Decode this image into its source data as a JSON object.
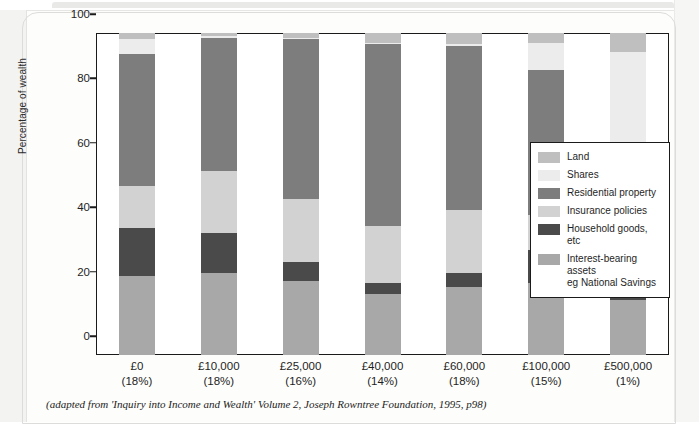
{
  "chart_data": {
    "type": "bar",
    "subtype": "stacked-percentage",
    "title": "",
    "xlabel": "",
    "ylabel": "Percentage of wealth",
    "ylim": [
      0,
      100
    ],
    "yticks": [
      0,
      20,
      40,
      60,
      80,
      100
    ],
    "grid": false,
    "legend_position": "right-inside",
    "categories": [
      "£0",
      "£10,000",
      "£25,000",
      "£40,000",
      "£60,000",
      "£100,000",
      "£500,000"
    ],
    "category_sublabels": [
      "(18%)",
      "(18%)",
      "(16%)",
      "(14%)",
      "(18%)",
      "(15%)",
      "(1%)"
    ],
    "series": [
      {
        "name": "Interest-bearing assets eg National Savings",
        "color": "#a8a8a8",
        "values": [
          24.5,
          25.5,
          23.0,
          19.0,
          21.0,
          22.5,
          17.0
        ]
      },
      {
        "name": "Household goods, etc",
        "color": "#4a4a4a",
        "values": [
          15.0,
          12.5,
          6.0,
          3.5,
          4.5,
          10.0,
          13.0
        ]
      },
      {
        "name": "Insurance policies",
        "color": "#d2d2d2",
        "values": [
          13.0,
          19.0,
          19.5,
          17.5,
          19.5,
          11.0,
          10.0
        ]
      },
      {
        "name": "Residential property",
        "color": "#7d7d7d",
        "values": [
          41.0,
          41.5,
          49.5,
          56.5,
          51.0,
          45.0,
          17.0
        ]
      },
      {
        "name": "Shares",
        "color": "#ececec",
        "values": [
          4.5,
          0.5,
          0.5,
          0.5,
          0.5,
          8.5,
          37.0
        ]
      },
      {
        "name": "Land",
        "color": "#bfbfbf",
        "values": [
          2.0,
          1.0,
          1.5,
          3.0,
          3.5,
          3.0,
          6.0
        ]
      }
    ]
  },
  "figure": {
    "y_axis_label": "Percentage of wealth",
    "y_ticks": [
      "0",
      "20",
      "40",
      "60",
      "80",
      "100"
    ],
    "x_ticks": [
      {
        "value": "£0",
        "share": "(18%)"
      },
      {
        "value": "£10,000",
        "share": "(18%)"
      },
      {
        "value": "£25,000",
        "share": "(16%)"
      },
      {
        "value": "£40,000",
        "share": "(14%)"
      },
      {
        "value": "£60,000",
        "share": "(18%)"
      },
      {
        "value": "£100,000",
        "share": "(15%)"
      },
      {
        "value": "£500,000",
        "share": "(1%)"
      }
    ],
    "legend": [
      {
        "label": "Land",
        "color": "#bfbfbf"
      },
      {
        "label": "Shares",
        "color": "#ececec"
      },
      {
        "label": "Residential property",
        "color": "#7d7d7d"
      },
      {
        "label": "Insurance policies",
        "color": "#d2d2d2"
      },
      {
        "label": "Household goods, etc",
        "color": "#4a4a4a"
      },
      {
        "label": "Interest-bearing assets eg National Savings",
        "color": "#a8a8a8"
      }
    ],
    "caption": "(adapted from 'Inquiry into Income and Wealth' Volume 2, Joseph Rowntree Foundation, 1995, p98)"
  },
  "colors": {
    "axis": "#1a1a1a",
    "text": "#1f1f1f",
    "paper": "#fdfdfb",
    "plot_background": "#ffffff"
  }
}
